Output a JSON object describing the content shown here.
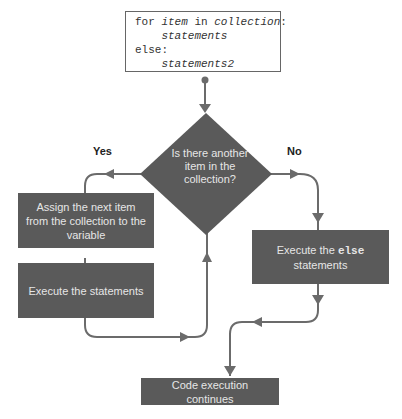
{
  "code": {
    "line1_prefix": "for ",
    "line1_var": "item",
    "line1_mid": " in ",
    "line1_coll": "collection",
    "line1_end": ":",
    "line2": "    statements",
    "line3": "else:",
    "line4": "    statements2"
  },
  "decision": {
    "text": "Is there another item in the collection?"
  },
  "branches": {
    "yes": "Yes",
    "no": "No"
  },
  "boxes": {
    "assign": "Assign the next item from the collection to the variable",
    "execute": "Execute the statements",
    "else_prefix": "Execute the ",
    "else_keyword": "else",
    "else_suffix": "statements",
    "continue": "Code execution continues"
  },
  "colors": {
    "box": "#5a5a5a",
    "line": "#6b6b6b",
    "text_on_box": "#e6e6e6"
  }
}
